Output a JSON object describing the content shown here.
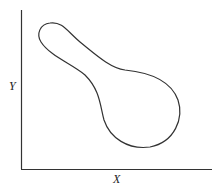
{
  "diagram": {
    "x_label": "X",
    "y_label": "Y",
    "shape": "closed contour (keyhole/spoon-shaped region) running from upper-left narrow lobe to lower-right wide lobe",
    "colors": {
      "line": "#333333",
      "background": "#ffffff"
    }
  }
}
